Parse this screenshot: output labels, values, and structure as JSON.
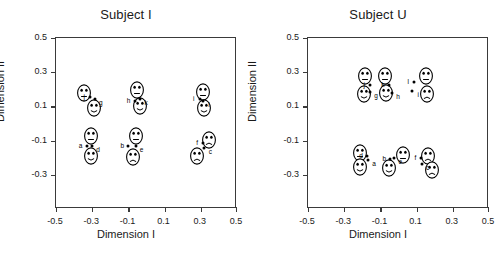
{
  "figure": {
    "width": 504,
    "height": 254,
    "background": "#ffffff",
    "ink_color": "#1a1a1a"
  },
  "chart_data": {
    "type": "scatter",
    "title": "",
    "panels": [
      {
        "title": "Subject I",
        "xlabel": "Dimension I",
        "ylabel": "Dimension II",
        "xlim": [
          -0.5,
          0.5
        ],
        "ylim": [
          -0.5,
          0.5
        ],
        "xticks": [
          -0.5,
          -0.3,
          -0.1,
          0.1,
          0.3,
          0.5
        ],
        "xticklabels": [
          "-0.5",
          "-0.3",
          "-0.1",
          "0.1",
          "0.3",
          "0.5"
        ],
        "yticks": [
          -0.3,
          -0.1,
          0.1,
          0.3,
          0.5
        ],
        "yticklabels": [
          "-0.3",
          "-0.1",
          "0.1",
          "0.3",
          "0.5"
        ],
        "grid": false,
        "legend": "none",
        "points": [
          {
            "label": "a",
            "x": -0.325,
            "y": -0.135
          },
          {
            "label": "d",
            "x": -0.295,
            "y": -0.135
          },
          {
            "label": "b",
            "x": -0.095,
            "y": -0.14
          },
          {
            "label": "e",
            "x": -0.055,
            "y": -0.138
          },
          {
            "label": "f",
            "x": 0.318,
            "y": -0.12
          },
          {
            "label": "c",
            "x": 0.325,
            "y": -0.148
          },
          {
            "label": "j",
            "x": -0.305,
            "y": 0.148
          },
          {
            "label": "g",
            "x": -0.28,
            "y": 0.138
          },
          {
            "label": "h",
            "x": -0.06,
            "y": 0.128
          },
          {
            "label": "k",
            "x": -0.03,
            "y": 0.14
          },
          {
            "label": "i",
            "x": 0.3,
            "y": 0.14
          },
          {
            "label": "l",
            "x": 0.318,
            "y": 0.128
          }
        ],
        "faces": [
          {
            "x": -0.34,
            "y": 0.175,
            "mouth": "neutral"
          },
          {
            "x": -0.283,
            "y": 0.082,
            "mouth": "smile"
          },
          {
            "x": -0.045,
            "y": 0.19,
            "mouth": "neutral"
          },
          {
            "x": -0.03,
            "y": 0.095,
            "mouth": "smile"
          },
          {
            "x": 0.315,
            "y": 0.18,
            "mouth": "neutral"
          },
          {
            "x": 0.325,
            "y": 0.085,
            "mouth": "smile"
          },
          {
            "x": -0.3,
            "y": -0.08,
            "mouth": "neutral"
          },
          {
            "x": -0.3,
            "y": -0.195,
            "mouth": "smile"
          },
          {
            "x": -0.055,
            "y": -0.08,
            "mouth": "neutral"
          },
          {
            "x": -0.07,
            "y": -0.2,
            "mouth": "frown"
          },
          {
            "x": 0.35,
            "y": -0.105,
            "mouth": "frown"
          },
          {
            "x": 0.285,
            "y": -0.195,
            "mouth": "frown"
          }
        ]
      },
      {
        "title": "Subject U",
        "xlabel": "Dimension I",
        "ylabel": "Dimension II",
        "xlim": [
          -0.5,
          0.5
        ],
        "ylim": [
          -0.5,
          0.5
        ],
        "xticks": [
          -0.5,
          -0.3,
          -0.1,
          0.1,
          0.3,
          0.5
        ],
        "xticklabels": [
          "-0.5",
          "-0.3",
          "-0.1",
          "0.1",
          "0.3",
          "0.5"
        ],
        "yticks": [
          -0.3,
          -0.1,
          0.1,
          0.3,
          0.5
        ],
        "yticklabels": [
          "-0.3",
          "-0.1",
          "0.1",
          "0.3",
          "0.5"
        ],
        "grid": false,
        "legend": "none",
        "points": [
          {
            "label": "j",
            "x": -0.15,
            "y": 0.218
          },
          {
            "label": "g",
            "x": -0.152,
            "y": 0.178
          },
          {
            "label": "k",
            "x": -0.048,
            "y": 0.222
          },
          {
            "label": "h",
            "x": -0.03,
            "y": 0.172
          },
          {
            "label": "l",
            "x": 0.092,
            "y": 0.235
          },
          {
            "label": "i",
            "x": 0.082,
            "y": 0.185
          },
          {
            "label": "d",
            "x": -0.168,
            "y": -0.196
          },
          {
            "label": "a",
            "x": -0.162,
            "y": -0.222
          },
          {
            "label": "b",
            "x": -0.04,
            "y": -0.213
          },
          {
            "label": "e",
            "x": -0.018,
            "y": -0.205
          },
          {
            "label": "f",
            "x": 0.132,
            "y": -0.205
          },
          {
            "label": "c",
            "x": 0.133,
            "y": -0.243
          }
        ],
        "faces": [
          {
            "x": -0.182,
            "y": 0.272,
            "mouth": "neutral"
          },
          {
            "x": -0.185,
            "y": 0.168,
            "mouth": "smile"
          },
          {
            "x": -0.068,
            "y": 0.272,
            "mouth": "neutral"
          },
          {
            "x": -0.062,
            "y": 0.17,
            "mouth": "smile"
          },
          {
            "x": 0.158,
            "y": 0.272,
            "mouth": "neutral"
          },
          {
            "x": 0.162,
            "y": 0.168,
            "mouth": "frown"
          },
          {
            "x": -0.205,
            "y": -0.18,
            "mouth": "neutral"
          },
          {
            "x": -0.208,
            "y": -0.258,
            "mouth": "smile"
          },
          {
            "x": 0.028,
            "y": -0.192,
            "mouth": "neutral"
          },
          {
            "x": -0.048,
            "y": -0.268,
            "mouth": "smile"
          },
          {
            "x": 0.17,
            "y": -0.195,
            "mouth": "frown"
          },
          {
            "x": 0.188,
            "y": -0.28,
            "mouth": "frown"
          }
        ]
      }
    ]
  }
}
